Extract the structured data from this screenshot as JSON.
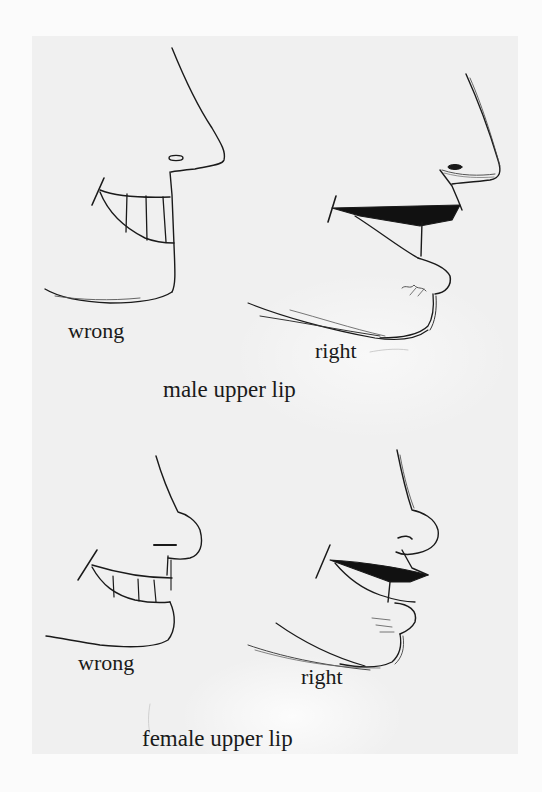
{
  "page": {
    "background": "#fbfbfb",
    "paper_color": "#f0f0f0",
    "ink_color": "#1a1a1a"
  },
  "sections": [
    {
      "caption": "male upper lip",
      "figures": [
        {
          "label": "wrong",
          "icon": "face-profile-wrong-male-illustration"
        },
        {
          "label": "right",
          "icon": "face-profile-right-male-illustration"
        }
      ]
    },
    {
      "caption": "female upper lip",
      "figures": [
        {
          "label": "wrong",
          "icon": "face-profile-wrong-female-illustration"
        },
        {
          "label": "right",
          "icon": "face-profile-right-female-illustration"
        }
      ]
    }
  ]
}
